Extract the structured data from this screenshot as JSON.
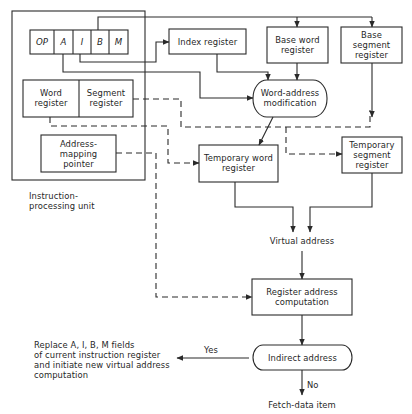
{
  "diagram": {
    "instruction_processing_unit": {
      "label_line1": "Instruction-",
      "label_line2": "processing unit",
      "instruction_register_fields": [
        "OP",
        "A",
        "I",
        "B",
        "M"
      ],
      "word_register": {
        "line1": "Word",
        "line2": "register"
      },
      "segment_register": {
        "line1": "Segment",
        "line2": "register"
      },
      "address_mapping_pointer": {
        "line1": "Address-",
        "line2": "mapping",
        "line3": "pointer"
      }
    },
    "index_register": {
      "label": "Index register"
    },
    "base_word_register": {
      "line1": "Base word",
      "line2": "register"
    },
    "base_segment_register": {
      "line1": "Base",
      "line2": "segment",
      "line3": "register"
    },
    "word_address_modification": {
      "line1": "Word-address",
      "line2": "modification"
    },
    "temporary_word_register": {
      "line1": "Temporary word",
      "line2": "register"
    },
    "temporary_segment_register": {
      "line1": "Temporary",
      "line2": "segment",
      "line3": "register"
    },
    "virtual_address": {
      "label": "Virtual address"
    },
    "register_address_computation": {
      "line1": "Register address",
      "line2": "computation"
    },
    "indirect_address": {
      "label": "Indirect address",
      "yes_label": "Yes",
      "no_label": "No"
    },
    "replace_note": {
      "line1": "Replace A, I, B, M fields",
      "line2": "of current instruction register",
      "line3": "and initiate new virtual address",
      "line4": "computation"
    },
    "fetch_data_item": {
      "label": "Fetch-data item"
    },
    "line_color": "#2a2a2a"
  }
}
